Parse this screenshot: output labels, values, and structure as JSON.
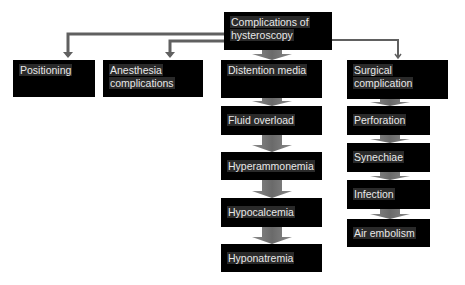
{
  "diagram": {
    "root": "Complications of hysteroscopy",
    "root_lines": [
      "Complications of",
      "hysteroscopy"
    ],
    "branches": [
      {
        "label": "Positioning",
        "children": []
      },
      {
        "label": "Anesthesia complications",
        "lines": [
          "Anesthesia",
          "complications"
        ],
        "children": []
      },
      {
        "label": "Distention media",
        "children": [
          "Fluid overload",
          "Hyperammonemia",
          "Hypocalcemia",
          "Hyponatremia"
        ]
      },
      {
        "label": "Surgical complication",
        "lines": [
          "Surgical",
          "complication"
        ],
        "children": [
          "Perforation",
          "Synechiae",
          "Infection",
          "Air embolism"
        ]
      }
    ]
  },
  "colors": {
    "box": "#000000",
    "text": "#e8e8e8",
    "connector": "#606060",
    "arrow": "#7a7a7a"
  }
}
